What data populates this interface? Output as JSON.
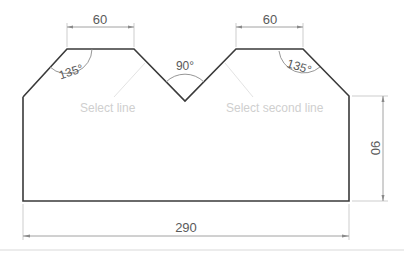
{
  "diagram": {
    "type": "technical-drawing",
    "dimensions": {
      "top_left_width": "60",
      "top_right_width": "60",
      "overall_width": "290",
      "right_height": "90"
    },
    "angles": {
      "left_corner": "135°",
      "right_corner": "135°",
      "v_notch": "90°"
    },
    "prompts": {
      "first": "Select line",
      "second": "Select second line"
    },
    "colors": {
      "outline": "#3a3a3a",
      "dimension": "#8a8a8a",
      "prompt_text": "#cfcfcf"
    }
  }
}
